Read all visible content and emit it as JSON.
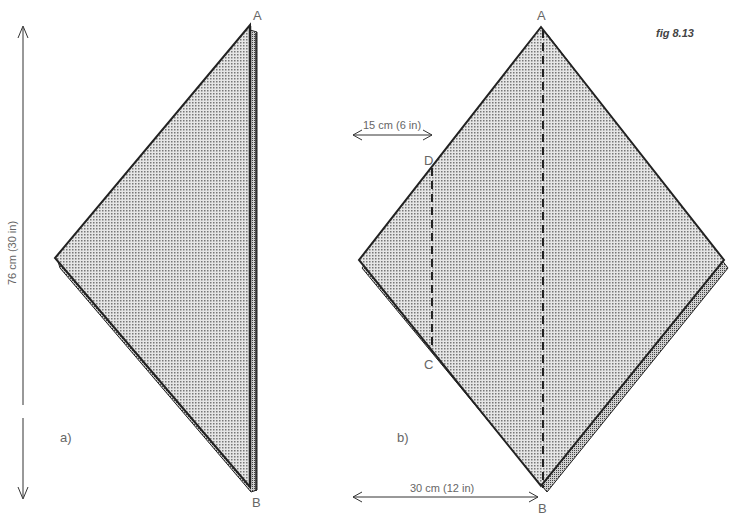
{
  "figure": {
    "caption": "fig 8.13",
    "panel_a": {
      "label": "a)",
      "vertex_top": "A",
      "vertex_bottom": "B",
      "height_dimension": "76 cm (30 in)"
    },
    "panel_b": {
      "label": "b)",
      "vertex_top": "A",
      "vertex_bottom": "B",
      "point_d": "D",
      "point_c": "C",
      "fold_offset_dimension": "15 cm (6 in)",
      "half_width_dimension": "30 cm (12 in)"
    },
    "colors": {
      "outline": "#222222",
      "fill_shade": "#bdbdbd",
      "text": "#666666"
    }
  }
}
